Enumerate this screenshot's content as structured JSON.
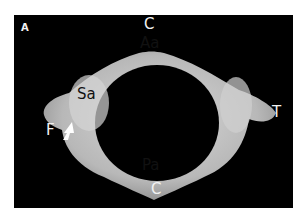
{
  "figure": {
    "panel_letter": "A",
    "labels": {
      "c_top": "C",
      "aa": "Aa",
      "sa": "Sa",
      "t": "T",
      "f": "F",
      "pa": "Pa",
      "c_bottom": "C"
    },
    "colors": {
      "background": "#000000",
      "bone": "#c8c8c8",
      "label_light": "#f2f2f2",
      "label_dark": "#111111"
    }
  }
}
